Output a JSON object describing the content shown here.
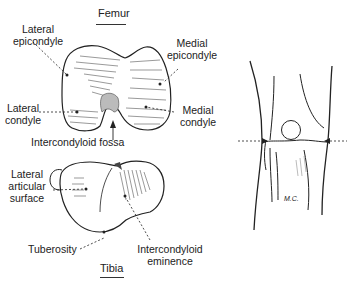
{
  "femur": {
    "title": "Femur",
    "labels": {
      "lateral_epicondyle_1": "Lateral",
      "lateral_epicondyle_2": "epicondyle",
      "medial_epicondyle_1": "Medial",
      "medial_epicondyle_2": "epicondyle",
      "lateral_condyle_1": "Lateral",
      "lateral_condyle_2": "condyle",
      "medial_condyle_1": "Medial",
      "medial_condyle_2": "condyle",
      "fossa": "Intercondyloid fossa"
    }
  },
  "tibia": {
    "title": "Tibia",
    "labels": {
      "lateral_articular_1": "Lateral",
      "lateral_articular_2": "articular",
      "lateral_articular_3": "surface",
      "tuberosity": "Tuberosity",
      "eminence_1": "Intercondyloid",
      "eminence_2": "eminence"
    }
  },
  "knee": {
    "initials": "M.C."
  },
  "colors": {
    "ink": "#1a1a1a",
    "background": "#ffffff"
  }
}
